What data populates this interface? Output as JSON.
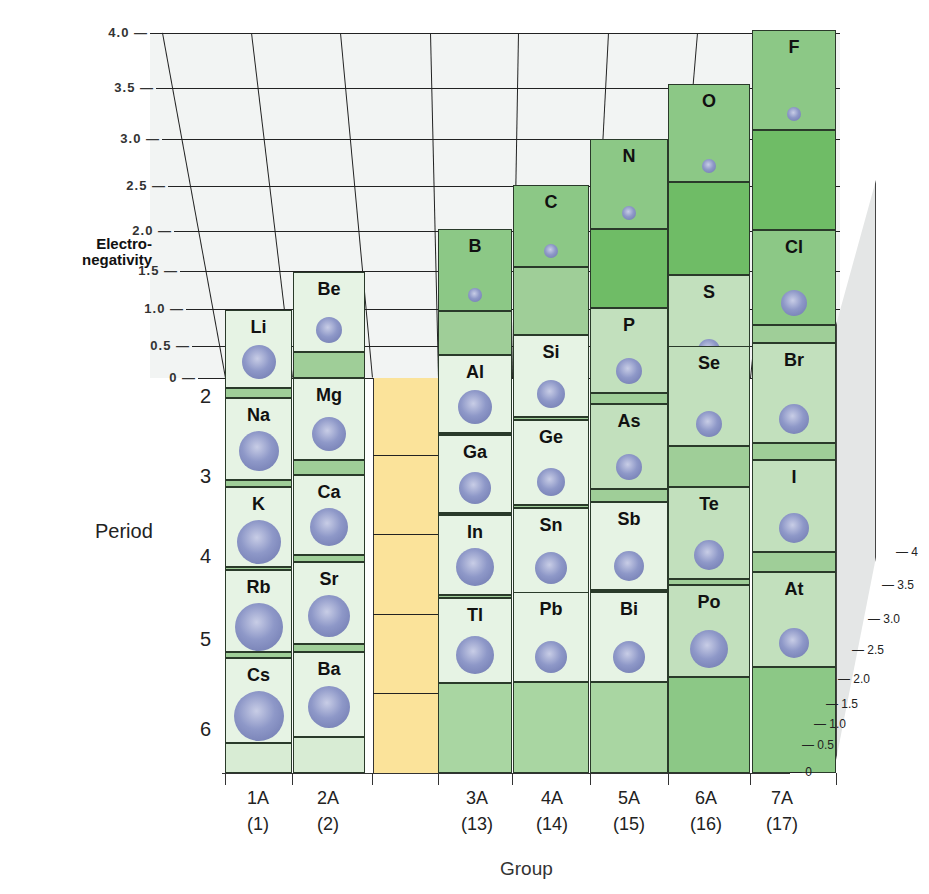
{
  "chart_data": {
    "type": "bar3d",
    "title": "",
    "xlabel": "Group",
    "ylabel": "Period",
    "zlabel": "Electro-negativity",
    "zlim": [
      0,
      4.0
    ],
    "z_ticks_left": [
      "4.0",
      "3.5",
      "3.0",
      "2.5",
      "2.0",
      "1.5",
      "1.0",
      "0.5",
      "0"
    ],
    "z_ticks_right": [
      "4",
      "3.5",
      "3.0",
      "2.5",
      "2.0",
      "1.5",
      "1.0",
      "0.5",
      "0"
    ],
    "periods": [
      "2",
      "3",
      "4",
      "5",
      "6"
    ],
    "groups": [
      {
        "label": "1A",
        "number": "(1)"
      },
      {
        "label": "2A",
        "number": "(2)"
      },
      {
        "label": "3A",
        "number": "(13)"
      },
      {
        "label": "4A",
        "number": "(14)"
      },
      {
        "label": "5A",
        "number": "(15)"
      },
      {
        "label": "6A",
        "number": "(16)"
      },
      {
        "label": "7A",
        "number": "(17)"
      }
    ],
    "series": [
      {
        "name": "1A",
        "elements": [
          "Li",
          "Na",
          "K",
          "Rb",
          "Cs"
        ],
        "values": [
          1.0,
          0.9,
          0.8,
          0.8,
          0.7
        ]
      },
      {
        "name": "2A",
        "elements": [
          "Be",
          "Mg",
          "Ca",
          "Sr",
          "Ba"
        ],
        "values": [
          1.5,
          1.2,
          1.0,
          1.0,
          0.9
        ]
      },
      {
        "name": "3A",
        "elements": [
          "B",
          "Al",
          "Ga",
          "In",
          "Tl"
        ],
        "values": [
          2.0,
          1.5,
          1.6,
          1.7,
          1.8
        ]
      },
      {
        "name": "4A",
        "elements": [
          "C",
          "Si",
          "Ge",
          "Sn",
          "Pb"
        ],
        "values": [
          2.5,
          1.8,
          1.8,
          1.8,
          1.9
        ]
      },
      {
        "name": "5A",
        "elements": [
          "N",
          "P",
          "As",
          "Sb",
          "Bi"
        ],
        "values": [
          3.0,
          2.1,
          2.0,
          1.9,
          1.9
        ]
      },
      {
        "name": "6A",
        "elements": [
          "O",
          "S",
          "Se",
          "Te",
          "Po"
        ],
        "values": [
          3.5,
          2.5,
          2.4,
          2.1,
          2.0
        ]
      },
      {
        "name": "7A",
        "elements": [
          "F",
          "Cl",
          "Br",
          "I",
          "At"
        ],
        "values": [
          4.0,
          3.0,
          2.8,
          2.5,
          2.2
        ]
      }
    ],
    "transition_metals_placeholder": true,
    "colors": {
      "low": "#e6f3e4",
      "mid": "#c2e0bd",
      "high": "#8cc886",
      "top": "#6fbc66",
      "transition": "#fbe39a",
      "atom": "#8e98c8",
      "backwall": "#f2f4f3"
    }
  },
  "labels": {
    "ylabel_line1": "Electro-",
    "ylabel_line2": "negativity",
    "period_title": "Period",
    "group_title": "Group"
  }
}
